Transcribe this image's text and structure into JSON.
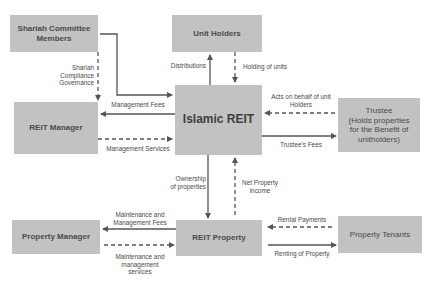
{
  "diagram": {
    "colors": {
      "box_fill": "#c2c2c2",
      "line": "#555555",
      "text": "#4a4a4a",
      "background": "#ffffff"
    },
    "nodes": {
      "shariah": "Shariah Committee Members",
      "unit_holders": "Unit Holders",
      "reit_manager": "REIT Manager",
      "islamic_reit": "Islamic REIT",
      "trustee": "Trustee (Holds properties for the Benefit of unitholders)",
      "trustee_l1": "Trustee",
      "trustee_l2": "(Holds properties",
      "trustee_l3": "for the Benefit of",
      "trustee_l4": "unitholders)",
      "property_manager": "Property Manager",
      "reit_property": "REIT Property",
      "property_tenants": "Property Tenants"
    },
    "edges": [
      {
        "from": "Shariah Committee Members",
        "to": "Islamic REIT",
        "style": "solid",
        "label": ""
      },
      {
        "from": "Shariah Committee Members",
        "to": "REIT Manager",
        "style": "dashed",
        "label": "Shariah Compliance Governance"
      },
      {
        "from": "Islamic REIT",
        "to": "Unit Holders",
        "style": "solid",
        "label": "Distributions"
      },
      {
        "from": "Unit Holders",
        "to": "Islamic REIT",
        "style": "dashed",
        "label": "Holding of units"
      },
      {
        "from": "Islamic REIT",
        "to": "REIT Manager",
        "style": "solid",
        "label": "Management Fees"
      },
      {
        "from": "REIT Manager",
        "to": "Islamic REIT",
        "style": "dashed",
        "label": "Management Services"
      },
      {
        "from": "Trustee",
        "to": "Islamic REIT",
        "style": "dashed",
        "label": "Acts on behalf of unit Holders"
      },
      {
        "from": "Islamic REIT",
        "to": "Trustee",
        "style": "solid",
        "label": "Trustee's Fees"
      },
      {
        "from": "Islamic REIT",
        "to": "REIT Property",
        "style": "solid",
        "label": "Ownership of properties"
      },
      {
        "from": "REIT Property",
        "to": "Islamic REIT",
        "style": "dashed",
        "label": "Net Property income"
      },
      {
        "from": "REIT Property",
        "to": "Property Manager",
        "style": "solid",
        "label": "Maintenance and Management Fees"
      },
      {
        "from": "Property Manager",
        "to": "REIT Property",
        "style": "dashed",
        "label": "Maintenance and management services"
      },
      {
        "from": "Property Tenants",
        "to": "REIT Property",
        "style": "dashed",
        "label": "Rental Payments"
      },
      {
        "from": "REIT Property",
        "to": "Property Tenants",
        "style": "solid",
        "label": "Renting of Property"
      }
    ],
    "labels": {
      "shariah_gov_l1": "Shariah",
      "shariah_gov_l2": "Compliance",
      "shariah_gov_l3": "Governance",
      "distributions": "Distributions",
      "holding_units": "Holding of units",
      "mgmt_fees": "Management Fees",
      "mgmt_services": "Management Services",
      "acts_l1": "Acts on behalf of unit",
      "acts_l2": "Holders",
      "trustee_fees": "Trustee's Fees",
      "ownership_l1": "Ownership",
      "ownership_l2": "of properties",
      "net_income_l1": "Net Property",
      "net_income_l2": "income",
      "maint_fees_l1": "Maintenance and",
      "maint_fees_l2": "Management Fees",
      "maint_serv_l1": "Maintenance and",
      "maint_serv_l2": "management",
      "maint_serv_l3": "services",
      "rental_payments": "Rental Payments",
      "renting": "Renting of Property"
    }
  }
}
